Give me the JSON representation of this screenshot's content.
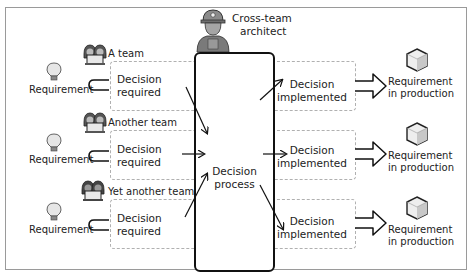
{
  "architect": {
    "label_line1": "Cross-team",
    "label_line2": "architect",
    "icon": "worker-with-hardhat-icon"
  },
  "process": {
    "label_line1": "Decision",
    "label_line2": "process"
  },
  "rows": [
    {
      "team": "A team",
      "requirement": "Requirement",
      "decision_line1": "Decision",
      "decision_line2": "required",
      "implemented_line1": "Decision",
      "implemented_line2": "implemented",
      "result_line1": "Requirement",
      "result_line2": "in production"
    },
    {
      "team": "Another team",
      "requirement": "Requirement",
      "decision_line1": "Decision",
      "decision_line2": "required",
      "implemented_line1": "Decision",
      "implemented_line2": "implemented",
      "result_line1": "Requirement",
      "result_line2": "in production"
    },
    {
      "team": "Yet another team",
      "requirement": "Requirement",
      "decision_line1": "Decision",
      "decision_line2": "required",
      "implemented_line1": "Decision",
      "implemented_line2": "implemented",
      "result_line1": "Requirement",
      "result_line2": "in production"
    }
  ],
  "icons": {
    "requirement": "lightbulb-icon",
    "team": "team-at-laptop-icon",
    "result": "cube-box-icon",
    "flow": "hollow-arrow-icon"
  },
  "colors": {
    "stroke": "#111111",
    "dashed_border": "#b0b0b0",
    "frame_border": "#9a9a9a",
    "icon_gray": "#7a7a7a",
    "icon_light": "#d8d8d8"
  }
}
